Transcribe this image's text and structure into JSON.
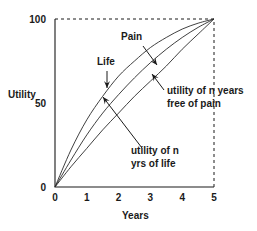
{
  "chart_data": {
    "type": "line",
    "title": "",
    "xlabel": "Years",
    "ylabel": "Utility",
    "xlim": [
      0,
      5
    ],
    "ylim": [
      0,
      100
    ],
    "x_ticks": [
      "0",
      "1",
      "2",
      "3",
      "4",
      "5"
    ],
    "y_ticks": [
      "0",
      "50",
      "100"
    ],
    "grid": false,
    "frame": "dashed top and right borders",
    "series": [
      {
        "name": "Life",
        "x": [
          0,
          0.5,
          1,
          1.5,
          2,
          2.5,
          3,
          3.5,
          4,
          4.5,
          5
        ],
        "y": [
          0,
          22,
          40,
          54,
          66,
          75,
          83,
          89,
          94,
          97.5,
          100
        ]
      },
      {
        "name": "Pain",
        "x": [
          0,
          0.5,
          1,
          1.5,
          2,
          2.5,
          3,
          3.5,
          4,
          4.5,
          5
        ],
        "y": [
          0,
          16,
          31,
          44,
          55,
          65,
          74,
          82,
          89,
          95,
          100
        ]
      },
      {
        "name": "utility of n years free of pain",
        "x": [
          0,
          0.5,
          1,
          1.5,
          2,
          2.5,
          3,
          3.5,
          4,
          4.5,
          5
        ],
        "y": [
          0,
          12,
          23,
          34,
          44,
          54,
          63,
          72,
          82,
          91,
          100
        ]
      }
    ],
    "annotations": [
      {
        "text": "Life",
        "points_to": "Life"
      },
      {
        "text": "Pain",
        "points_to": "Pain"
      },
      {
        "text": "utility of n years",
        "line2": "free of pain",
        "points_to": "utility of n years free of pain"
      },
      {
        "text": "utility of n",
        "line2": "yrs of life",
        "points_to": "Life"
      }
    ]
  }
}
